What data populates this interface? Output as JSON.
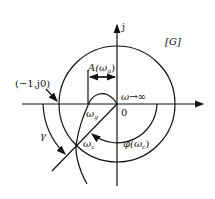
{
  "diagram": {
    "labels": {
      "imag_axis": "j",
      "plane": "[G]",
      "critical_point": "(−1,j0)",
      "gain_at_wg": "A(ω",
      "gain_at_wg_sub": "g",
      "gain_at_wg_close": ")",
      "omega_inf": "ω→∞",
      "origin": "0",
      "omega_g": "ω",
      "omega_g_sub": "g",
      "omega_c": "ω",
      "omega_c_sub": "c",
      "phase_at_wc": "φ(ω",
      "phase_at_wc_sub": "c",
      "phase_at_wc_close": ")",
      "phase_margin": "γ"
    },
    "colors": {
      "stroke": "#111111",
      "background": "#ffffff"
    }
  }
}
